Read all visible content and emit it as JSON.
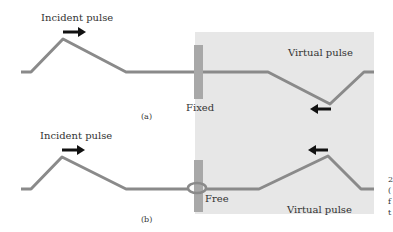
{
  "figure": {
    "panel_a": {
      "incident_label": "Incident pulse",
      "virtual_label": "Virtual pulse",
      "boundary_label": "Fixed",
      "caption": "(a)"
    },
    "panel_b": {
      "incident_label": "Incident pulse",
      "virtual_label": "Virtual pulse",
      "boundary_label": "Free",
      "caption": "(b)"
    },
    "side_text": [
      "2",
      "(",
      "f",
      "t"
    ],
    "colors": {
      "string": "#8a8a8a",
      "wall": "#a8a8a8",
      "virtual_region": "#e7e7e7",
      "arrow": "#111111"
    }
  }
}
